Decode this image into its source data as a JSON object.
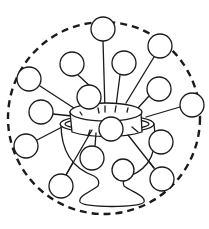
{
  "illustration": {
    "subject": "cup-with-radiating-circles",
    "colors": {
      "line": "#1a1a1a",
      "background": "#ffffff"
    },
    "enclosure": {
      "cx": 104,
      "cy": 118,
      "r": 96,
      "style": "dashed"
    },
    "nodes": [
      {
        "cx": 103,
        "cy": 29,
        "r": 12
      },
      {
        "cx": 160,
        "cy": 46,
        "r": 12
      },
      {
        "cx": 72,
        "cy": 64,
        "r": 12
      },
      {
        "cx": 124,
        "cy": 63,
        "r": 12
      },
      {
        "cx": 29,
        "cy": 79,
        "r": 12
      },
      {
        "cx": 89,
        "cy": 97,
        "r": 12
      },
      {
        "cx": 159,
        "cy": 89,
        "r": 12
      },
      {
        "cx": 192,
        "cy": 105,
        "r": 12
      },
      {
        "cx": 41,
        "cy": 112,
        "r": 12
      },
      {
        "cx": 111,
        "cy": 129,
        "r": 12
      },
      {
        "cx": 26,
        "cy": 146,
        "r": 12
      },
      {
        "cx": 161,
        "cy": 142,
        "r": 12
      },
      {
        "cx": 92,
        "cy": 158,
        "r": 12
      },
      {
        "cx": 123,
        "cy": 170,
        "r": 11
      },
      {
        "cx": 61,
        "cy": 186,
        "r": 12
      },
      {
        "cx": 162,
        "cy": 179,
        "r": 12
      }
    ]
  }
}
